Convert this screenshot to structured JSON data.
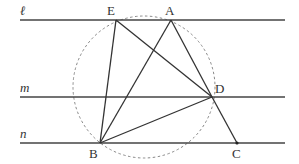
{
  "diagram": {
    "type": "geometry",
    "colors": {
      "line": "#444444",
      "circle": "#888888",
      "label": "#333333"
    },
    "lines": [
      {
        "name": "ℓ",
        "y": 20,
        "x1": 20,
        "x2": 285
      },
      {
        "name": "m",
        "y": 97,
        "x1": 20,
        "x2": 285
      },
      {
        "name": "n",
        "y": 143,
        "x1": 20,
        "x2": 285
      }
    ],
    "points": {
      "E": {
        "label": "E",
        "x": 116,
        "y": 20
      },
      "A": {
        "label": "A",
        "x": 171,
        "y": 20
      },
      "D": {
        "label": "D",
        "x": 212,
        "y": 97
      },
      "B": {
        "label": "B",
        "x": 100,
        "y": 143
      },
      "C": {
        "label": "C",
        "x": 237,
        "y": 143
      }
    },
    "segments": [
      [
        "E",
        "B"
      ],
      [
        "E",
        "D"
      ],
      [
        "A",
        "B"
      ],
      [
        "A",
        "D"
      ],
      [
        "B",
        "D"
      ],
      [
        "D",
        "C"
      ]
    ],
    "circle": {
      "cx": 144,
      "cy": 87,
      "r": 71,
      "style": "dashed",
      "through": [
        "E",
        "A",
        "D",
        "B"
      ]
    },
    "labels": {
      "line_l": "ℓ",
      "line_m": "m",
      "line_n": "n",
      "E": "E",
      "A": "A",
      "D": "D",
      "B": "B",
      "C": "C"
    }
  }
}
